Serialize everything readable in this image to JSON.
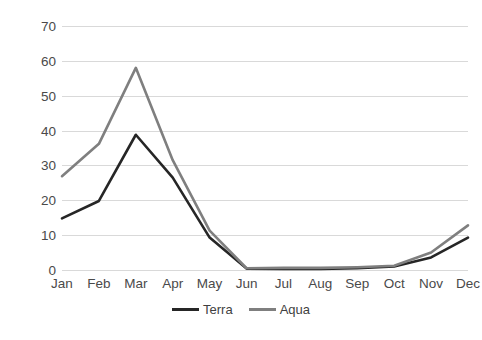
{
  "chart_data": {
    "type": "line",
    "title": "",
    "xlabel": "",
    "ylabel": "MODIS fire counts",
    "categories": [
      "Jan",
      "Feb",
      "Mar",
      "Apr",
      "May",
      "Jun",
      "Jul",
      "Aug",
      "Sep",
      "Oct",
      "Nov",
      "Dec"
    ],
    "series": [
      {
        "name": "Terra",
        "color": "#262626",
        "values": [
          14.8,
          19.8,
          38.8,
          26.5,
          9.3,
          0.4,
          0.3,
          0.3,
          0.5,
          1.0,
          3.6,
          9.3
        ]
      },
      {
        "name": "Aqua",
        "color": "#7f7f7f",
        "values": [
          26.9,
          36.2,
          58.0,
          31.5,
          11.3,
          0.5,
          0.6,
          0.6,
          0.8,
          1.2,
          5.0,
          12.8
        ]
      }
    ],
    "ylim": [
      0,
      70
    ],
    "yticks": [
      0,
      10,
      20,
      30,
      40,
      50,
      60,
      70
    ],
    "ytick_labels": [
      "0",
      "10",
      "20",
      "30",
      "40",
      "50",
      "60",
      "70"
    ],
    "grid": true,
    "grid_color": "#d9d9d9",
    "legend_position": "bottom"
  },
  "legend": {
    "entries": [
      {
        "label": "Terra",
        "color": "#262626"
      },
      {
        "label": "Aqua",
        "color": "#7f7f7f"
      }
    ]
  },
  "axes": {
    "y_title": "MODIS fire counts"
  }
}
